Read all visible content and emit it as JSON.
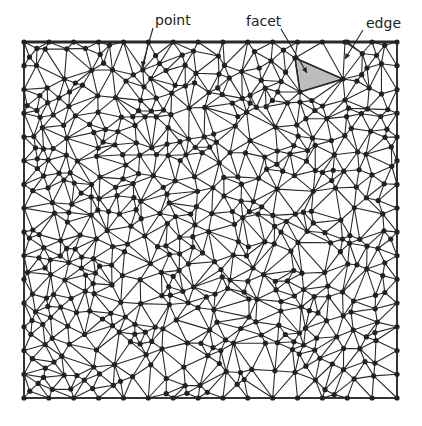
{
  "diagram": {
    "type": "delaunay-triangulation",
    "frame": {
      "x0": 24,
      "y0": 42,
      "x1": 397,
      "y1": 398
    },
    "colors": {
      "edge": "#2a2a2a",
      "point": "#222222",
      "facet_fill": "#bdbdbd",
      "background": "#ffffff"
    },
    "point_count": 560,
    "seed": 7,
    "labels": [
      {
        "id": "point",
        "text": "point",
        "x": 155,
        "y": 13,
        "arrow_from": [
          153,
          28
        ],
        "arrow_to": [
          142,
          67
        ]
      },
      {
        "id": "facet",
        "text": "facet",
        "x": 246,
        "y": 14,
        "arrow_from": [
          281,
          29
        ],
        "arrow_to": [
          307,
          73
        ]
      },
      {
        "id": "edge",
        "text": "edge",
        "x": 366,
        "y": 16,
        "arrow_from": [
          363,
          30
        ],
        "arrow_to": [
          345,
          59
        ]
      }
    ],
    "facet": [
      [
        295,
        58
      ],
      [
        343,
        79
      ],
      [
        300,
        92
      ]
    ],
    "fixed_points": [
      [
        295,
        58
      ],
      [
        343,
        79
      ],
      [
        300,
        92
      ],
      [
        345,
        42
      ],
      [
        345,
        100
      ]
    ]
  }
}
